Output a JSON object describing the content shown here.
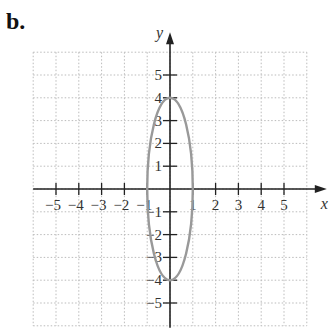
{
  "figure_label": "b.",
  "chart_data": {
    "type": "line",
    "title": "",
    "curve": "ellipse x^2/1 + y^2/16 = 1",
    "xlabel": "x",
    "ylabel": "y",
    "xlim": [
      -6,
      6
    ],
    "ylim": [
      -6,
      6
    ],
    "grid": true,
    "x_ticks": [
      "-5",
      "-4",
      "-3",
      "-2",
      "-1",
      "1",
      "2",
      "3",
      "4",
      "5"
    ],
    "y_ticks": [
      "5",
      "4",
      "3",
      "2",
      "1",
      "-1",
      "-2",
      "-3",
      "-4",
      "-5"
    ],
    "series": [
      {
        "name": "ellipse",
        "center": [
          0,
          0
        ],
        "semi_axis_x": 1,
        "semi_axis_y": 4,
        "vertices": [
          [
            0,
            4
          ],
          [
            0,
            -4
          ]
        ],
        "co_vertices": [
          [
            1,
            0
          ],
          [
            -1,
            0
          ]
        ],
        "color": "#999999"
      }
    ]
  },
  "colors": {
    "axis": "#222222",
    "grid": "#bbbbbb",
    "curve": "#999999"
  }
}
